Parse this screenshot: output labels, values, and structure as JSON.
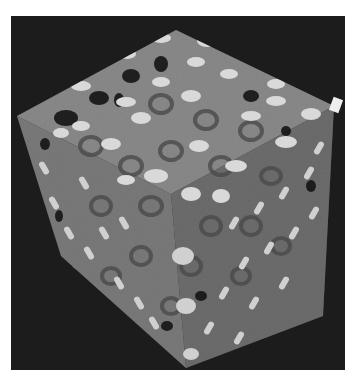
{
  "image": {
    "subject": "3D rendered porous gyroid lattice cube",
    "background_color": "#1c1c1c",
    "page_color": "#ffffff",
    "palette": {
      "face_top": "#8a8a8a",
      "face_left": "#7c7c7c",
      "face_right": "#6e6e6e",
      "highlight": "#d9d9d9",
      "pore": "#151515",
      "ring": "#4a4a4a"
    }
  }
}
